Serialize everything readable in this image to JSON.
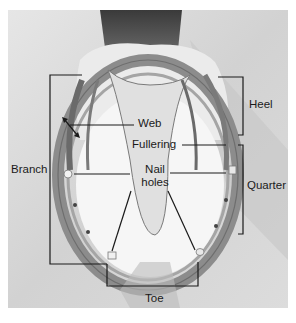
{
  "figure": {
    "labels": {
      "heel": "Heel",
      "web": "Web",
      "fullering": "Fullering",
      "branch": "Branch",
      "nail_holes_line1": "Nail",
      "nail_holes_line2": "holes",
      "quarter": "Quarter",
      "toe": "Toe"
    }
  },
  "colors": {
    "line": "#1a1a1a",
    "photo_bg": "#d9d9d9",
    "shoe": "#8a8a8a"
  }
}
